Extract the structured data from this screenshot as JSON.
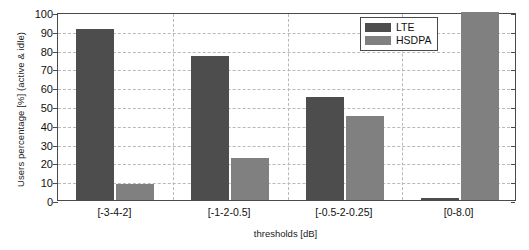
{
  "chart_data": {
    "type": "bar",
    "title": "",
    "xlabel": "thresholds [dB]",
    "ylabel": "Users percentage [%] (active & idle)",
    "categories": [
      "[-3-4-2]",
      "[-1-2-0.5]",
      "[-0.5-2-0.25]",
      "[0-8.0]"
    ],
    "series": [
      {
        "name": "LTE",
        "color": "#4d4d4d",
        "values": [
          91,
          76.5,
          55,
          1
        ]
      },
      {
        "name": "HSDPA",
        "color": "#808080",
        "values": [
          8.5,
          22.5,
          44.5,
          100
        ]
      }
    ],
    "ylim": [
      0,
      100
    ],
    "yticks": [
      0,
      10,
      20,
      30,
      40,
      50,
      60,
      70,
      80,
      90,
      100
    ],
    "ytick_labels": [
      "0",
      "10",
      "20",
      "30",
      "40",
      "50",
      "60",
      "70",
      "80",
      "90",
      "100"
    ],
    "grid": "horizontal-dashed-and-vertical-group-separators",
    "legend_position": "top-right",
    "legend": [
      "LTE",
      "HSDPA"
    ]
  }
}
